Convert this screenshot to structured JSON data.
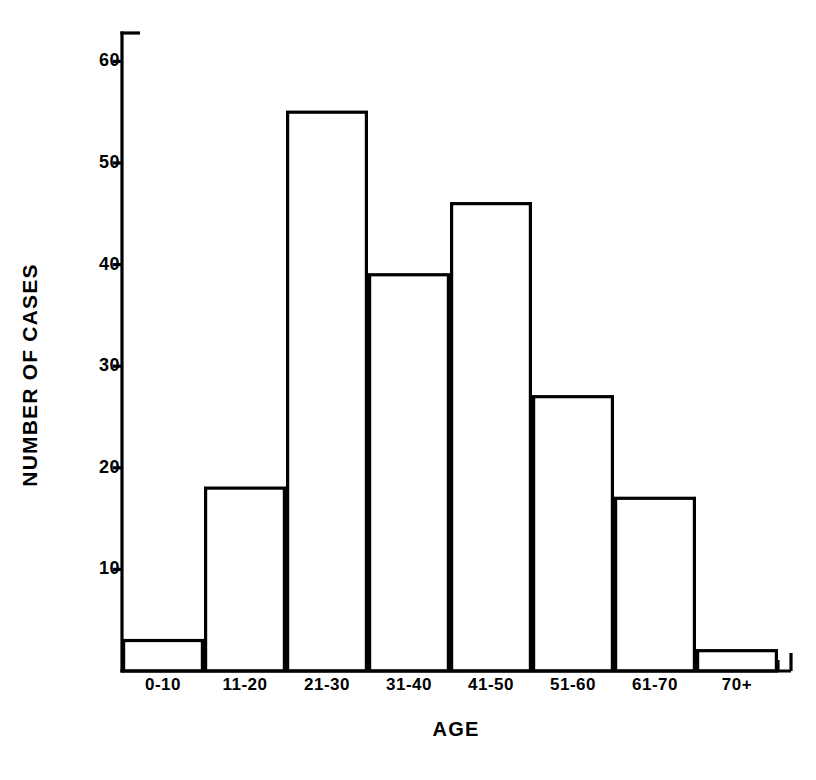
{
  "chart_data": {
    "type": "bar",
    "title": "",
    "subtitle": "",
    "xlabel": "AGE",
    "ylabel": "NUMBER OF CASES",
    "categories": [
      "0-10",
      "11-20",
      "21-30",
      "31-40",
      "41-50",
      "51-60",
      "61-70",
      "70+"
    ],
    "values": [
      3,
      18,
      55,
      39,
      46,
      27,
      17,
      2
    ],
    "series": [
      {
        "name": "Number of cases",
        "values": [
          3,
          18,
          55,
          39,
          46,
          27,
          17,
          2
        ]
      }
    ],
    "ylim": [
      0,
      63
    ],
    "yticks": [
      10,
      20,
      30,
      40,
      50,
      60
    ],
    "ytick_labels": [
      "10",
      "20",
      "30",
      "40",
      "50",
      "60"
    ],
    "xtick_labels": [
      "0-10",
      "11-20",
      "21-30",
      "31-40",
      "41-50",
      "51-60",
      "61-70",
      "70+"
    ],
    "grid": false,
    "legend": null,
    "legend_position": "none",
    "bar_fill_color": "#ffffff",
    "bar_edge_color": "#000000",
    "axis_color": "#000000",
    "background_color": "#ffffff",
    "annotations": []
  },
  "figure": {
    "y_axis_title": "NUMBER OF CASES",
    "x_axis_title": "AGE"
  }
}
